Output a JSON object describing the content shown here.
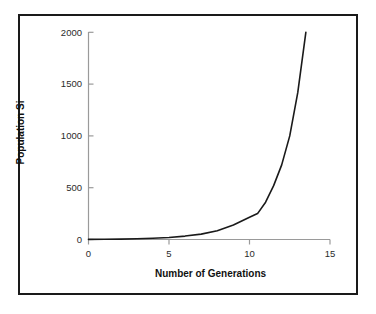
{
  "chart_data": {
    "type": "line",
    "title": "",
    "xlabel": "Number of Generations",
    "ylabel": "Population Si",
    "xlim": [
      0,
      15
    ],
    "ylim": [
      0,
      2000
    ],
    "xticks": [
      "0",
      "5",
      "10",
      "15"
    ],
    "xtick_values": [
      0,
      5,
      10,
      15
    ],
    "yticks": [
      "0",
      "500",
      "1000",
      "1500",
      "2000"
    ],
    "ytick_values": [
      0,
      500,
      1000,
      1500,
      2000
    ],
    "grid": false,
    "legend": "none",
    "series": [
      {
        "name": "Population Si",
        "x": [
          0,
          1,
          2,
          3,
          4,
          5,
          6,
          7,
          8,
          9,
          10,
          10.5,
          11,
          11.5,
          12,
          12.5,
          13,
          13.5
        ],
        "values": [
          1,
          2,
          4,
          7,
          12,
          20,
          33,
          52,
          85,
          140,
          215,
          250,
          360,
          520,
          720,
          1000,
          1420,
          2000
        ]
      }
    ],
    "line_color": "#1a1a1a",
    "axis_color": "#9a9a9a",
    "frame_color": "#1a1a1a",
    "background_color": "#ffffff",
    "annotations": []
  },
  "axis_labels": {
    "y": "Population Si",
    "x": "Number of Generations"
  }
}
